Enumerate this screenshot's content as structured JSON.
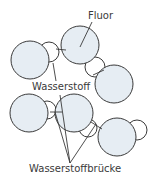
{
  "diagram": {
    "colors": {
      "fluorine_fill": "#e6edf3",
      "hydrogen_fill": "#ffffff",
      "stroke": "#3a3a3a",
      "label": "#3a3a3a"
    },
    "labels": {
      "fluorine": "Fluor",
      "hydrogen": "Wasserstoff",
      "hydrogen_bond": "Wasserstoffbrücke"
    },
    "atoms": [
      {
        "id": "F1",
        "element": "F",
        "cx": 30,
        "cy": 60,
        "r": 19
      },
      {
        "id": "F2",
        "element": "F",
        "cx": 80,
        "cy": 45,
        "r": 19
      },
      {
        "id": "F3",
        "element": "F",
        "cx": 114,
        "cy": 84,
        "r": 19
      },
      {
        "id": "F4",
        "element": "F",
        "cx": 29,
        "cy": 113,
        "r": 19
      },
      {
        "id": "F5",
        "element": "F",
        "cx": 74,
        "cy": 113,
        "r": 19
      },
      {
        "id": "F6",
        "element": "F",
        "cx": 117,
        "cy": 137,
        "r": 19
      },
      {
        "id": "H1",
        "element": "H",
        "cx": 49,
        "cy": 52,
        "r": 10
      },
      {
        "id": "H2",
        "element": "H",
        "cx": 95,
        "cy": 67,
        "r": 10
      },
      {
        "id": "H3",
        "element": "H",
        "cx": 47,
        "cy": 110,
        "r": 9
      },
      {
        "id": "H4",
        "element": "H",
        "cx": 88,
        "cy": 128,
        "r": 9
      },
      {
        "id": "H5",
        "element": "H",
        "cx": 137,
        "cy": 130,
        "r": 10
      }
    ]
  }
}
